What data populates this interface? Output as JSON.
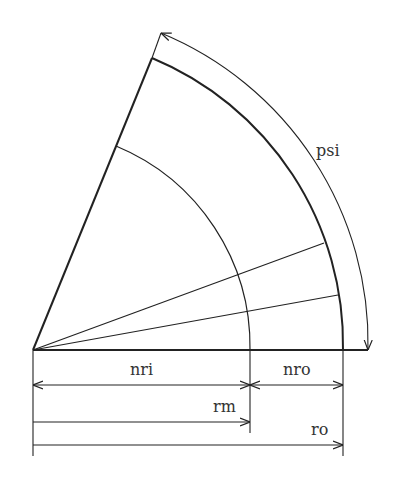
{
  "diagram": {
    "type": "annular sector cross-section",
    "labels": {
      "psi": "psi",
      "nri": "nri",
      "nro": "nro",
      "rm": "rm",
      "ro": "ro"
    },
    "colors": {
      "line": "#222222",
      "background": "#ffffff"
    }
  }
}
